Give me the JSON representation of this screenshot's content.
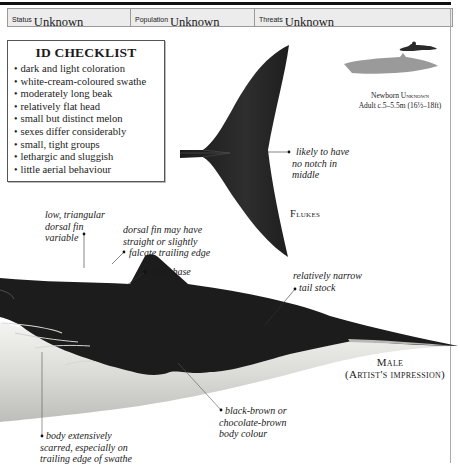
{
  "header": {
    "cells": [
      {
        "label": "Status",
        "value": "Unknown"
      },
      {
        "label": "Population",
        "value": "Unknown"
      },
      {
        "label": "Threats",
        "value": "Unknown"
      }
    ]
  },
  "checklist": {
    "title": "ID CHECKLIST",
    "items": [
      "dark and light coloration",
      "white-cream-coloured swathe",
      "moderately long beak",
      "relatively flat head",
      "small but distinct melon",
      "sexes differ considerably",
      "small, tight groups",
      "lethargic and sluggish",
      "little aerial behaviour"
    ]
  },
  "scale": {
    "newborn_label": "Newborn",
    "newborn_value": "Unknown",
    "adult_label": "Adult",
    "adult_value": "c.5–5.5m (16½–18ft)",
    "icons": [
      "whale-silhouette-icon",
      "swimmer-silhouette-icon"
    ]
  },
  "flukes": {
    "annotation": [
      "likely to have",
      "no notch in",
      "middle"
    ],
    "caption": "Flukes"
  },
  "body": {
    "annotations": {
      "dorsal_fin": [
        "low, triangular",
        "dorsal fin",
        "variable"
      ],
      "trailing_edge": [
        "dorsal fin may have",
        "straight or slightly",
        "falcate trailing edge"
      ],
      "wide_base": "wide base",
      "tail_stock": [
        "relatively narrow",
        "tail stock"
      ],
      "body_colour": [
        "black-brown or",
        "chocolate-brown",
        "body colour"
      ],
      "scarred": [
        "body extensively",
        "scarred, especially on",
        "trailing edge of swathe"
      ]
    },
    "caption_line1": "Male",
    "caption_line2": "(Artist's impression)"
  },
  "colors": {
    "whale_dark": "#1c1c1c",
    "whale_light": "#d9d9d6",
    "silhouette_gray": "#9a9a9a",
    "header_bg": "#ececec"
  }
}
